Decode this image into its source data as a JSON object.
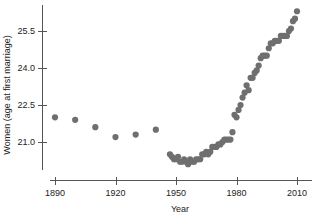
{
  "chart_data": {
    "type": "scatter",
    "title": "",
    "xlabel": "Year",
    "ylabel": "Women (age at first marriage)",
    "xlim": [
      1884,
      2014
    ],
    "ylim": [
      20.15,
      26.6
    ],
    "grid": false,
    "legend": null,
    "marker": {
      "shape": "circle",
      "color": "#6f6f6f",
      "size_px": 3.1
    },
    "axis_color": "#555555",
    "background": "#ffffff",
    "xticks": [
      1890,
      1920,
      1950,
      1980,
      2010
    ],
    "xtick_labels": [
      "1890",
      "1920",
      "1950",
      "1980",
      "2010"
    ],
    "yticks": [
      21.0,
      22.5,
      24.0,
      25.5
    ],
    "ytick_labels": [
      "21.0",
      "22.5",
      "24.0",
      "25.5"
    ],
    "x": [
      1890,
      1900,
      1910,
      1920,
      1930,
      1940,
      1947,
      1948,
      1949,
      1950,
      1951,
      1952,
      1953,
      1954,
      1955,
      1956,
      1957,
      1958,
      1959,
      1960,
      1961,
      1962,
      1963,
      1964,
      1965,
      1966,
      1967,
      1968,
      1969,
      1970,
      1971,
      1972,
      1973,
      1974,
      1975,
      1976,
      1977,
      1978,
      1979,
      1980,
      1981,
      1982,
      1983,
      1984,
      1985,
      1986,
      1987,
      1988,
      1989,
      1990,
      1991,
      1992,
      1993,
      1994,
      1995,
      1996,
      1997,
      1998,
      1999,
      2000,
      2001,
      2002,
      2003,
      2004,
      2005,
      2006,
      2007,
      2008,
      2009,
      2010
    ],
    "y": [
      22.0,
      21.9,
      21.6,
      21.2,
      21.3,
      21.5,
      20.5,
      20.4,
      20.3,
      20.3,
      20.4,
      20.2,
      20.2,
      20.3,
      20.2,
      20.1,
      20.3,
      20.2,
      20.2,
      20.3,
      20.3,
      20.3,
      20.5,
      20.5,
      20.6,
      20.5,
      20.6,
      20.8,
      20.8,
      20.8,
      20.9,
      20.9,
      21.0,
      21.1,
      21.1,
      21.1,
      21.1,
      21.4,
      22.1,
      22.0,
      22.3,
      22.5,
      22.8,
      23.0,
      23.3,
      23.1,
      23.6,
      23.6,
      23.8,
      23.9,
      24.1,
      24.4,
      24.5,
      24.5,
      24.5,
      24.8,
      25.0,
      25.0,
      25.1,
      25.1,
      25.1,
      25.3,
      25.3,
      25.3,
      25.3,
      25.5,
      25.6,
      25.9,
      26.0,
      26.3
    ]
  },
  "axes": {
    "x_title": "Year",
    "y_title": "Women (age at first marriage)"
  }
}
